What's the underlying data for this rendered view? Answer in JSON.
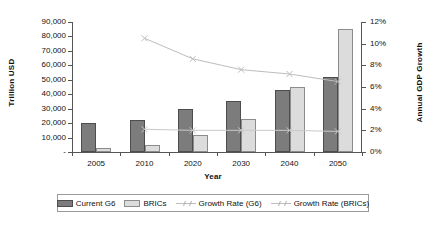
{
  "chart_data": {
    "type": "bar",
    "title": "",
    "subtitle": "",
    "xlabel": "Year",
    "ylabel": "Trillion USD",
    "ylabel_secondary": "Annual GDP Growth",
    "categories": [
      "2005",
      "2010",
      "2020",
      "2030",
      "2040",
      "2050"
    ],
    "ylim": [
      0,
      90000
    ],
    "ylim_secondary": [
      0,
      12
    ],
    "ytick_labels": [
      "-",
      "10,000",
      "20,000",
      "30,000",
      "40,000",
      "50,000",
      "60,000",
      "70,000",
      "80,000",
      "90,000"
    ],
    "ytick_values": [
      0,
      10000,
      20000,
      30000,
      40000,
      50000,
      60000,
      70000,
      80000,
      90000
    ],
    "ytick_labels_secondary": [
      "0%",
      "2%",
      "4%",
      "6%",
      "8%",
      "10%",
      "12%"
    ],
    "ytick_values_secondary": [
      0,
      2,
      4,
      6,
      8,
      10,
      12
    ],
    "grid": false,
    "legend_position": "bottom",
    "series": [
      {
        "name": "Current G6",
        "kind": "bar",
        "axis": "left",
        "color": "#7c7c7c",
        "values": [
          20000,
          22500,
          30000,
          35000,
          43000,
          52000
        ]
      },
      {
        "name": "BRICs",
        "kind": "bar",
        "axis": "left",
        "color": "#dcdcdc",
        "values": [
          3000,
          5000,
          12000,
          23000,
          45000,
          85000
        ]
      },
      {
        "name": "Growth Rate (G6)",
        "kind": "line",
        "axis": "right",
        "color": "#c9c9c9",
        "values": [
          null,
          2.1,
          2.0,
          2.0,
          2.0,
          1.9
        ]
      },
      {
        "name": "Growth Rate (BRICs)",
        "kind": "line",
        "axis": "right",
        "color": "#bdbdbd",
        "values": [
          null,
          10.5,
          8.6,
          7.6,
          7.2,
          6.5
        ]
      }
    ]
  },
  "legend": {
    "items": [
      {
        "label": "Current G6",
        "icon": "filled-square-swatch-dark"
      },
      {
        "label": "BRICs",
        "icon": "filled-square-swatch-light"
      },
      {
        "label": "Growth Rate (G6)",
        "icon": "line-marker-swatch"
      },
      {
        "label": "Growth Rate (BRICs)",
        "icon": "line-marker-swatch"
      }
    ]
  }
}
